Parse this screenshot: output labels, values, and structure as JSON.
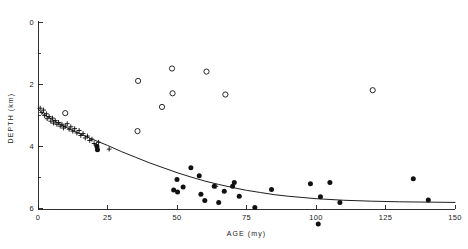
{
  "figure": {
    "background": "#ffffff",
    "ink": "#1a1a1a"
  },
  "axes": {
    "x": {
      "label": "AGE  (my)",
      "min": 0,
      "max": 150,
      "major_ticks": [
        0,
        25,
        50,
        75,
        100,
        125,
        150
      ],
      "major_tick_labels": [
        "0",
        "25",
        "50",
        "75",
        "100",
        "125",
        "150"
      ],
      "minor_ticks": [],
      "px_min": 38,
      "px_max": 455,
      "px_axis_y": 209
    },
    "y": {
      "label": "DEPTH  (km)",
      "min": 0,
      "max": 6.8,
      "major_ticks": [
        0,
        2,
        4,
        6
      ],
      "major_tick_labels": [
        "0",
        "2",
        "4",
        "6"
      ],
      "minor_ticks": [
        1,
        3,
        5
      ],
      "px_min_value": 0,
      "px_top": 22,
      "px_per_unit": 31,
      "px_axis_x": 38,
      "inverted": true
    }
  },
  "chart_data": {
    "type": "scatter",
    "title": "",
    "xlabel": "AGE  (my)",
    "ylabel": "DEPTH  (km)",
    "xlim": [
      0,
      150
    ],
    "ylim": [
      6.8,
      0
    ],
    "grid": false,
    "legend": "none",
    "y_inverted": true,
    "series": [
      {
        "name": "plus-markers",
        "marker": "plus",
        "color": "#111111",
        "points": [
          [
            0.8,
            2.78
          ],
          [
            1.4,
            2.92
          ],
          [
            2.0,
            2.84
          ],
          [
            2.4,
            3.02
          ],
          [
            3.0,
            2.96
          ],
          [
            3.3,
            3.12
          ],
          [
            4.0,
            3.05
          ],
          [
            4.6,
            3.2
          ],
          [
            5.2,
            3.1
          ],
          [
            5.6,
            3.26
          ],
          [
            6.2,
            3.18
          ],
          [
            6.8,
            3.3
          ],
          [
            7.4,
            3.24
          ],
          [
            8.0,
            3.36
          ],
          [
            8.6,
            3.3
          ],
          [
            9.2,
            3.42
          ],
          [
            9.8,
            3.36
          ],
          [
            10.5,
            3.28
          ],
          [
            11.2,
            3.46
          ],
          [
            11.8,
            3.38
          ],
          [
            12.5,
            3.52
          ],
          [
            13.2,
            3.44
          ],
          [
            14.0,
            3.58
          ],
          [
            14.8,
            3.5
          ],
          [
            15.4,
            3.66
          ],
          [
            16.2,
            3.6
          ],
          [
            17.0,
            3.74
          ],
          [
            17.8,
            3.68
          ],
          [
            18.6,
            3.82
          ],
          [
            19.4,
            3.78
          ],
          [
            20.2,
            3.92
          ],
          [
            21.0,
            3.96
          ],
          [
            21.8,
            3.88
          ],
          [
            25.6,
            4.1
          ],
          [
            64.0,
            5.3
          ]
        ]
      },
      {
        "name": "filled-circles",
        "marker": "filled-circle",
        "color": "#111111",
        "points": [
          [
            21.2,
            4.02
          ],
          [
            21.4,
            4.12
          ],
          [
            48.8,
            5.42
          ],
          [
            50.0,
            5.08
          ],
          [
            50.2,
            5.48
          ],
          [
            52.2,
            5.32
          ],
          [
            55.0,
            4.7
          ],
          [
            58.0,
            4.96
          ],
          [
            58.6,
            5.56
          ],
          [
            60.0,
            5.76
          ],
          [
            63.4,
            5.3
          ],
          [
            65.0,
            5.82
          ],
          [
            67.0,
            5.46
          ],
          [
            70.0,
            5.3
          ],
          [
            70.6,
            5.18
          ],
          [
            72.4,
            5.62
          ],
          [
            78.0,
            5.98
          ],
          [
            84.0,
            5.4
          ],
          [
            98.0,
            5.22
          ],
          [
            100.8,
            6.52
          ],
          [
            101.6,
            5.64
          ],
          [
            105.0,
            5.18
          ],
          [
            108.6,
            5.82
          ],
          [
            135.0,
            5.06
          ],
          [
            140.4,
            5.74
          ]
        ]
      },
      {
        "name": "open-circles",
        "marker": "open-circle",
        "color": "#111111",
        "points": [
          [
            9.8,
            2.94
          ],
          [
            35.8,
            3.52
          ],
          [
            36.0,
            1.9
          ],
          [
            44.6,
            2.74
          ],
          [
            48.2,
            1.5
          ],
          [
            48.4,
            2.3
          ],
          [
            60.6,
            1.6
          ],
          [
            67.4,
            2.34
          ],
          [
            120.4,
            2.2
          ]
        ]
      }
    ],
    "curve": {
      "name": "subsidence-fit",
      "type": "line",
      "color": "#111111",
      "description": "smooth monotonically deepening best-fit curve",
      "points": [
        [
          0,
          2.8
        ],
        [
          2,
          2.98
        ],
        [
          5,
          3.14
        ],
        [
          8,
          3.3
        ],
        [
          12,
          3.48
        ],
        [
          16,
          3.64
        ],
        [
          20,
          3.8
        ],
        [
          25,
          3.98
        ],
        [
          30,
          4.18
        ],
        [
          35,
          4.36
        ],
        [
          40,
          4.54
        ],
        [
          45,
          4.7
        ],
        [
          50,
          4.86
        ],
        [
          55,
          5.0
        ],
        [
          60,
          5.13
        ],
        [
          65,
          5.24
        ],
        [
          70,
          5.34
        ],
        [
          75,
          5.43
        ],
        [
          80,
          5.5
        ],
        [
          85,
          5.57
        ],
        [
          90,
          5.62
        ],
        [
          95,
          5.66
        ],
        [
          100,
          5.7
        ],
        [
          110,
          5.75
        ],
        [
          120,
          5.78
        ],
        [
          130,
          5.8
        ],
        [
          140,
          5.81
        ],
        [
          150,
          5.82
        ]
      ]
    }
  }
}
